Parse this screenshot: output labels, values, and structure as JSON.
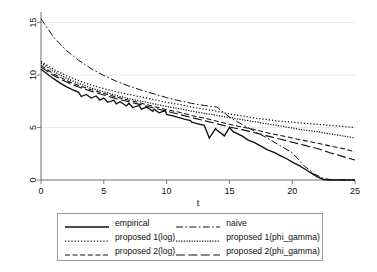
{
  "chart_data": {
    "type": "line",
    "title": "",
    "subtitle": "",
    "xlabel": "t",
    "ylabel": "",
    "xlim": [
      0,
      25
    ],
    "ylim": [
      0,
      16
    ],
    "xticks": [
      "0",
      "5",
      "10",
      "15",
      "20",
      "25"
    ],
    "xtick_values": [
      0,
      5,
      10,
      15,
      20,
      25
    ],
    "yticks": [
      "0",
      "5",
      "10",
      "15"
    ],
    "ytick_values": [
      0,
      5,
      10,
      15
    ],
    "grid": "horizontal-faint",
    "legend_position": "below-plot",
    "series": [
      {
        "name": "empirical",
        "style": "solid",
        "x": [
          0,
          0.5,
          1,
          1.5,
          2,
          2.5,
          3,
          3.2,
          3.6,
          4,
          4.4,
          4.7,
          5,
          5.3,
          5.8,
          6,
          6.3,
          6.8,
          7,
          7.3,
          7.8,
          8,
          8.4,
          8.9,
          9,
          9.4,
          9.9,
          10,
          10.5,
          11,
          11.4,
          11.9,
          12,
          12.5,
          13,
          13.4,
          13.9,
          14,
          14.6,
          15,
          15.3,
          16,
          16.5,
          17,
          17.4,
          18,
          18.6,
          19,
          19.6,
          20,
          20.6,
          21,
          21.4,
          22,
          22.5,
          23,
          24,
          25
        ],
        "values": [
          10.55,
          10.1,
          9.65,
          9.25,
          8.9,
          8.6,
          8.35,
          7.95,
          8.15,
          7.8,
          8.0,
          7.6,
          7.8,
          7.4,
          7.6,
          7.25,
          7.45,
          7.05,
          7.3,
          6.9,
          7.1,
          6.75,
          6.95,
          6.55,
          6.75,
          6.4,
          6.6,
          6.25,
          6.1,
          5.95,
          5.8,
          5.65,
          5.5,
          5.35,
          5.2,
          4.0,
          4.9,
          4.75,
          4.2,
          5.0,
          4.6,
          4.2,
          3.8,
          3.55,
          3.3,
          2.9,
          2.6,
          2.35,
          2.0,
          1.7,
          1.35,
          1.05,
          0.75,
          0.3,
          0.05,
          0.0,
          0.0,
          0.0
        ]
      },
      {
        "name": "naive",
        "style": "dash-dot",
        "x": [
          0,
          1,
          2,
          3,
          4,
          5,
          6,
          7,
          8,
          9,
          10,
          11,
          12,
          13,
          14,
          15,
          15.4,
          16,
          17,
          18,
          19,
          20,
          21,
          21.8,
          22.5,
          23,
          25
        ],
        "values": [
          15.35,
          13.6,
          12.35,
          11.4,
          10.6,
          9.95,
          9.4,
          8.95,
          8.55,
          8.2,
          7.85,
          7.55,
          7.3,
          7.1,
          6.95,
          6.0,
          5.7,
          5.3,
          4.65,
          4.0,
          3.3,
          2.6,
          1.3,
          0.55,
          0.15,
          0.05,
          0.0
        ]
      },
      {
        "name": "proposed 1(log)",
        "style": "dotted-fine",
        "x": [
          0,
          1,
          2,
          3,
          4,
          5,
          6,
          7,
          8,
          9,
          10,
          11,
          12,
          13,
          14,
          15,
          16,
          17,
          18,
          19,
          20,
          21,
          22,
          23,
          24,
          25
        ],
        "values": [
          11.3,
          10.55,
          9.95,
          9.45,
          9.05,
          8.7,
          8.4,
          8.15,
          7.9,
          7.65,
          7.4,
          7.2,
          6.95,
          6.75,
          6.55,
          6.3,
          6.1,
          5.9,
          5.75,
          5.6,
          5.5,
          5.4,
          5.3,
          5.2,
          5.1,
          5.0
        ]
      },
      {
        "name": "proposed 1(phi_gamma)",
        "style": "dotted-dense",
        "x": [
          0,
          1,
          2,
          3,
          4,
          5,
          6,
          7,
          8,
          9,
          10,
          11,
          12,
          13,
          14,
          15,
          16,
          17,
          18,
          19,
          20,
          21,
          22,
          23,
          24,
          25
        ],
        "values": [
          11.15,
          10.35,
          9.7,
          9.2,
          8.75,
          8.4,
          8.05,
          7.75,
          7.5,
          7.25,
          7.0,
          6.8,
          6.55,
          6.35,
          6.15,
          5.95,
          5.75,
          5.55,
          5.35,
          5.15,
          4.95,
          4.75,
          4.6,
          4.4,
          4.2,
          4.0
        ]
      },
      {
        "name": "proposed 2(log)",
        "style": "dashed",
        "x": [
          0,
          1,
          2,
          3,
          4,
          5,
          6,
          7,
          8,
          9,
          10,
          11,
          12,
          13,
          14,
          15,
          16,
          17,
          18,
          19,
          20,
          21,
          22,
          23,
          24,
          25
        ],
        "values": [
          10.9,
          10.1,
          9.5,
          9.0,
          8.6,
          8.25,
          7.9,
          7.6,
          7.3,
          7.0,
          6.7,
          6.45,
          6.15,
          5.9,
          5.6,
          5.3,
          5.05,
          4.8,
          4.5,
          4.25,
          4.0,
          3.75,
          3.5,
          3.25,
          3.0,
          2.7
        ]
      },
      {
        "name": "proposed 2(phi_gamma)",
        "style": "long-dash",
        "x": [
          0,
          1,
          2,
          3,
          4,
          5,
          6,
          7,
          8,
          9,
          10,
          11,
          12,
          13,
          14,
          15,
          16,
          17,
          18,
          19,
          20,
          21,
          22,
          23,
          24,
          25
        ],
        "values": [
          10.75,
          9.95,
          9.35,
          8.85,
          8.45,
          8.1,
          7.75,
          7.45,
          7.15,
          6.85,
          6.55,
          6.25,
          5.95,
          5.65,
          5.35,
          5.05,
          4.8,
          4.5,
          4.2,
          3.9,
          3.6,
          3.3,
          3.0,
          2.6,
          2.25,
          1.9
        ]
      }
    ]
  },
  "legend": {
    "entries": [
      {
        "label": "empirical",
        "swatch": "solid"
      },
      {
        "label": "naive",
        "swatch": "dash-dot"
      },
      {
        "label": "proposed 1(log)",
        "swatch": "dotted-fine"
      },
      {
        "label": "proposed 1(phi_gamma)",
        "swatch": "dotted-dense"
      },
      {
        "label": "proposed 2(log)",
        "swatch": "dashed"
      },
      {
        "label": "proposed 2(phi_gamma)",
        "swatch": "long-dash"
      }
    ]
  },
  "colors": {
    "line": "#101010",
    "axis": "#6f6f6f",
    "grid": "#e8e8e8",
    "legend_border": "#9a9a9a",
    "background": "#ffffff"
  }
}
